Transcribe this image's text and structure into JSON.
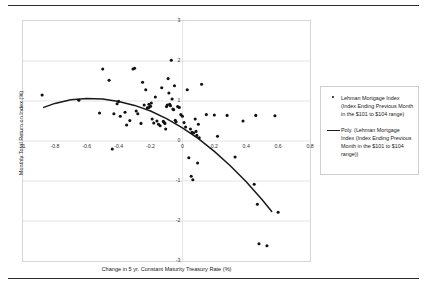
{
  "chart_data": {
    "type": "scatter",
    "title": "",
    "xlabel": "Change in 5 yr. Constant Maturity Treasury Rate (%)",
    "ylabel": "Monthly Total Return on Index (%)",
    "xlim": [
      -1,
      0.8
    ],
    "ylim": [
      -3,
      3
    ],
    "xticks": [
      "-1",
      "-0.8",
      "-0.6",
      "-0.4",
      "-0.2",
      "0",
      "0.2",
      "0.4",
      "0.6",
      "0.8"
    ],
    "xtick_values": [
      -1,
      -0.8,
      -0.6,
      -0.4,
      -0.2,
      0,
      0.2,
      0.4,
      0.6,
      0.8
    ],
    "yticks": [
      "3",
      "2",
      "1",
      "0",
      "-1",
      "-2",
      "-3"
    ],
    "ytick_values": [
      3,
      2,
      1,
      0,
      -1,
      -2,
      -3
    ],
    "grid": "horizontal-and-zero-vertical",
    "legend_position": "right-outside",
    "marker_color": "#111111",
    "trendline_color": "#1a1a1a",
    "series": [
      {
        "name": "Lehman Mortgage Index (Index Ending Previous Month in the $101 to $104 range)",
        "type": "scatter",
        "points": [
          [
            -0.88,
            1.15
          ],
          [
            -0.65,
            1.02
          ],
          [
            -0.52,
            0.7
          ],
          [
            -0.5,
            1.8
          ],
          [
            -0.46,
            1.52
          ],
          [
            -0.44,
            -0.2
          ],
          [
            -0.43,
            0.68
          ],
          [
            -0.41,
            0.93
          ],
          [
            -0.4,
            0.99
          ],
          [
            -0.39,
            0.62
          ],
          [
            -0.36,
            0.72
          ],
          [
            -0.35,
            0.4
          ],
          [
            -0.33,
            0.51
          ],
          [
            -0.31,
            1.8
          ],
          [
            -0.3,
            1.82
          ],
          [
            -0.29,
            0.75
          ],
          [
            -0.28,
            0.68
          ],
          [
            -0.26,
            0.44
          ],
          [
            -0.25,
            1.47
          ],
          [
            -0.24,
            0.9
          ],
          [
            -0.23,
            1.28
          ],
          [
            -0.22,
            0.83
          ],
          [
            -0.21,
            0.84
          ],
          [
            -0.21,
            0.92
          ],
          [
            -0.2,
            0.87
          ],
          [
            -0.195,
            0.95
          ],
          [
            -0.19,
            0.55
          ],
          [
            -0.18,
            0.45
          ],
          [
            -0.17,
            1.1
          ],
          [
            -0.16,
            0.5
          ],
          [
            -0.15,
            0.42
          ],
          [
            -0.14,
            0.38
          ],
          [
            -0.13,
            1.33
          ],
          [
            -0.12,
            0.49
          ],
          [
            -0.115,
            0.47
          ],
          [
            -0.11,
            0.44
          ],
          [
            -0.105,
            0.3
          ],
          [
            -0.1,
            0.86
          ],
          [
            -0.095,
            0.9
          ],
          [
            -0.09,
            1.56
          ],
          [
            -0.085,
            1.2
          ],
          [
            -0.08,
            0.92
          ],
          [
            -0.075,
            0.88
          ],
          [
            -0.07,
            2.02
          ],
          [
            -0.065,
            1.05
          ],
          [
            -0.06,
            0.8
          ],
          [
            -0.055,
            0.78
          ],
          [
            -0.05,
            1.38
          ],
          [
            -0.045,
            0.52
          ],
          [
            -0.04,
            0.48
          ],
          [
            -0.03,
            0.86
          ],
          [
            -0.02,
            0.84
          ],
          [
            -0.01,
            0.66
          ],
          [
            0.0,
            0.62
          ],
          [
            0.01,
            0.46
          ],
          [
            0.02,
            0.35
          ],
          [
            0.03,
            1.28
          ],
          [
            0.04,
            -0.42
          ],
          [
            0.05,
            0.3
          ],
          [
            0.055,
            -0.88
          ],
          [
            0.06,
            0.22
          ],
          [
            0.065,
            -0.97
          ],
          [
            0.07,
            0.2
          ],
          [
            0.08,
            0.55
          ],
          [
            0.085,
            0.24
          ],
          [
            0.09,
            0.14
          ],
          [
            0.095,
            -0.55
          ],
          [
            0.1,
            0.42
          ],
          [
            0.105,
            0.08
          ],
          [
            0.12,
            1.42
          ],
          [
            0.15,
            0.66
          ],
          [
            0.2,
            0.65
          ],
          [
            0.22,
            0.12
          ],
          [
            0.28,
            0.64
          ],
          [
            0.33,
            -0.4
          ],
          [
            0.38,
            0.5
          ],
          [
            0.45,
            -1.08
          ],
          [
            0.46,
            0.64
          ],
          [
            0.47,
            -1.58
          ],
          [
            0.48,
            -2.57
          ],
          [
            0.53,
            -2.62
          ],
          [
            0.58,
            0.63
          ],
          [
            0.6,
            -1.78
          ]
        ]
      },
      {
        "name": "Poly. (Lehman Mortgage Index (Index Ending Previous Month in the $101 to $104 range))",
        "type": "line",
        "fit": "polynomial-order-2",
        "curve": [
          [
            -0.87,
            0.84
          ],
          [
            -0.8,
            0.94
          ],
          [
            -0.7,
            1.03
          ],
          [
            -0.6,
            1.06
          ],
          [
            -0.5,
            1.05
          ],
          [
            -0.4,
            0.99
          ],
          [
            -0.3,
            0.89
          ],
          [
            -0.2,
            0.75
          ],
          [
            -0.1,
            0.56
          ],
          [
            0.0,
            0.33
          ],
          [
            0.1,
            0.06
          ],
          [
            0.2,
            -0.26
          ],
          [
            0.3,
            -0.62
          ],
          [
            0.4,
            -1.02
          ],
          [
            0.5,
            -1.47
          ],
          [
            0.56,
            -1.76
          ]
        ]
      }
    ]
  },
  "legend": {
    "entries": [
      {
        "marker": "dot",
        "label": "Lehman Mortgage Index (Index Ending Previous Month in the $101 to $104 range)"
      },
      {
        "marker": "line",
        "label": "Poly. (Lehman Mortgage Index (Index Ending Previous Month in the $101 to $104 range))"
      }
    ]
  }
}
